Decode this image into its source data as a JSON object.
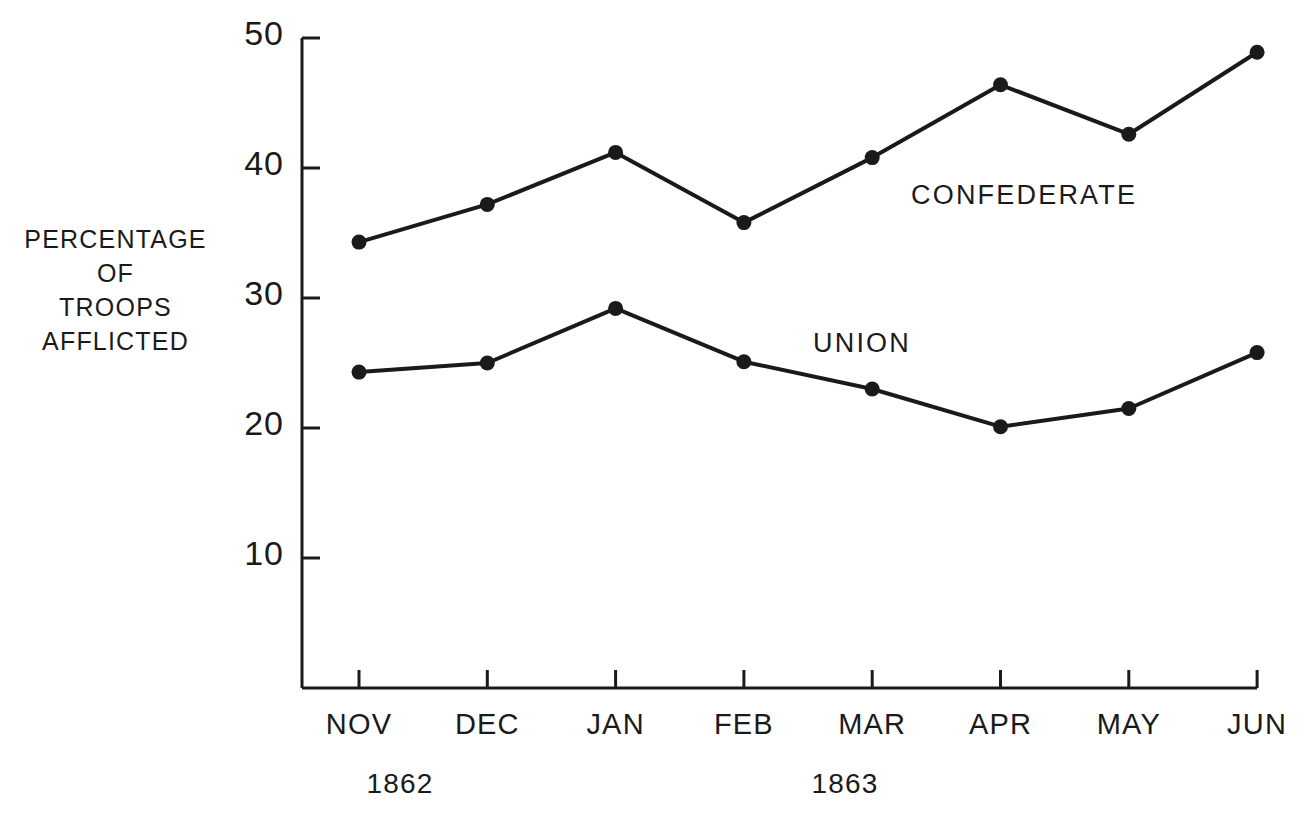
{
  "axis_label": {
    "lines": [
      "PERCENTAGE",
      "OF",
      "TROOPS",
      "AFFLICTED"
    ]
  },
  "annotations": {
    "confederate": "CONFEDERATE",
    "union": "UNION"
  },
  "year_labels": [
    {
      "text": "1862",
      "center_x": 400
    },
    {
      "text": "1863",
      "center_x": 845
    }
  ],
  "chart_data": {
    "type": "line",
    "title": "",
    "xlabel": "",
    "ylabel": "PERCENTAGE OF TROOPS AFFLICTED",
    "categories": [
      "NOV",
      "DEC",
      "JAN",
      "FEB",
      "MAR",
      "APR",
      "MAY",
      "JUN"
    ],
    "ylim": [
      0,
      50
    ],
    "yticks": [
      50,
      40,
      30,
      20,
      10
    ],
    "ytick_labels": [
      "50",
      "40",
      "30",
      "20",
      "10"
    ],
    "grid": false,
    "legend": "inline-annotation",
    "series": [
      {
        "name": "CONFEDERATE",
        "values": [
          34.3,
          37.2,
          41.2,
          35.8,
          40.8,
          46.4,
          42.6,
          48.9
        ]
      },
      {
        "name": "UNION",
        "values": [
          24.3,
          25.0,
          29.2,
          25.1,
          23.0,
          20.1,
          21.5,
          25.8
        ]
      }
    ]
  },
  "geometry": {
    "axis_x": 302,
    "axis_top_y": 38,
    "axis_bottom_y": 688,
    "y_value_top": 50,
    "px_per_unit": 13.0,
    "x_first": 359,
    "x_step": 128.3,
    "tick_len": 18,
    "marker_radius": 7.5
  }
}
